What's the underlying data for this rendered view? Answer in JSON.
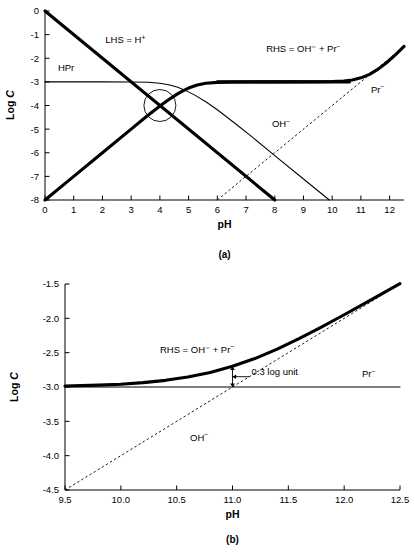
{
  "figure": {
    "type": "multi-panel-line-chart",
    "panels": [
      {
        "id": "a",
        "caption": "(a)",
        "xlabel": "pH",
        "ylabel": "Log C",
        "xlim": [
          0,
          12.5
        ],
        "ylim": [
          -8,
          0
        ],
        "xticks": [
          0,
          1,
          2,
          3,
          4,
          5,
          6,
          7,
          8,
          9,
          10,
          11,
          12
        ],
        "xtick_labels": [
          "0",
          "1",
          "2",
          "3",
          "4",
          "5",
          "6",
          "7",
          "8",
          "9",
          "10",
          "11",
          "12"
        ],
        "yticks": [
          0,
          -1,
          -2,
          -3,
          -4,
          -5,
          -6,
          -7,
          -8
        ],
        "ytick_labels": [
          "0",
          "-1",
          "-2",
          "-3",
          "-4",
          "-5",
          "-6",
          "-7",
          "-8"
        ],
        "grid": false,
        "labels": [
          {
            "name": "lhs-label",
            "text": "LHS = H",
            "sup": "+",
            "x": 2.1,
            "y": -1.35
          },
          {
            "name": "hpr-label",
            "text": "HPr",
            "sup": "",
            "x": 0.45,
            "y": -2.55
          },
          {
            "name": "rhs-label",
            "text": "RHS = OH⁻ + Pr",
            "sup": "−",
            "x": 7.7,
            "y": -1.75
          },
          {
            "name": "pr-label",
            "text": "Pr",
            "sup": "−",
            "x": 11.35,
            "y": -3.45
          },
          {
            "name": "oh-label",
            "text": "OH",
            "sup": "−",
            "x": 7.9,
            "y": -4.9
          }
        ],
        "annotation_circle": {
          "name": "intersection-highlight",
          "cx": 4.0,
          "cy": -4.0,
          "r_px": 16
        },
        "series": [
          {
            "name": "LHS = H+",
            "style": "thick",
            "comment": "log[H+] = -pH, straight line from (0,0) to (8,-8)",
            "points": [
              [
                0,
                0
              ],
              [
                8,
                -8
              ]
            ]
          },
          {
            "name": "Pr-",
            "style": "thick",
            "comment": "rises with slope 1 below pKa then plateaus at -3",
            "points": [
              [
                0,
                -8
              ],
              [
                1,
                -7
              ],
              [
                2,
                -6
              ],
              [
                3,
                -5
              ],
              [
                3.5,
                -4.5
              ],
              [
                4,
                -4.02
              ],
              [
                4.3,
                -3.76
              ],
              [
                4.6,
                -3.52
              ],
              [
                4.8,
                -3.38
              ],
              [
                5.0,
                -3.26
              ],
              [
                5.3,
                -3.13
              ],
              [
                5.6,
                -3.06
              ],
              [
                6.0,
                -3.02
              ],
              [
                6.5,
                -3.005
              ],
              [
                7.5,
                -3.0
              ],
              [
                9.0,
                -3.0
              ],
              [
                10.0,
                -3.0
              ],
              [
                10.6,
                -3.0
              ]
            ]
          },
          {
            "name": "HPr",
            "style": "thin",
            "comment": "flat at -3 below pKa, falls with slope -1 above",
            "points": [
              [
                0,
                -3.0
              ],
              [
                2.0,
                -3.0
              ],
              [
                3.0,
                -3.005
              ],
              [
                3.6,
                -3.02
              ],
              [
                4.0,
                -3.06
              ],
              [
                4.3,
                -3.12
              ],
              [
                4.6,
                -3.22
              ],
              [
                4.87,
                -3.35
              ],
              [
                5.2,
                -3.55
              ],
              [
                5.6,
                -3.84
              ],
              [
                6.0,
                -4.18
              ],
              [
                6.6,
                -4.74
              ],
              [
                7.2,
                -5.32
              ],
              [
                8.0,
                -6.12
              ],
              [
                9.0,
                -7.11
              ],
              [
                9.9,
                -8.0
              ]
            ]
          },
          {
            "name": "OH-",
            "style": "dashed",
            "comment": "log[OH-] = pH - 14, straight dashed line",
            "points": [
              [
                6.0,
                -8.0
              ],
              [
                12.5,
                -1.5
              ]
            ]
          },
          {
            "name": "RHS = OH- + Pr-",
            "style": "thick",
            "comment": "sum of OH- and Pr- curves, merges with Pr- plateau then rises",
            "points": [
              [
                6.0,
                -3.0
              ],
              [
                8.0,
                -3.0
              ],
              [
                9.5,
                -2.995
              ],
              [
                10.0,
                -2.985
              ],
              [
                10.4,
                -2.96
              ],
              [
                10.7,
                -2.92
              ],
              [
                11.0,
                -2.83
              ],
              [
                11.3,
                -2.68
              ],
              [
                11.6,
                -2.46
              ],
              [
                11.9,
                -2.18
              ],
              [
                12.2,
                -1.86
              ],
              [
                12.5,
                -1.5
              ]
            ]
          }
        ]
      },
      {
        "id": "b",
        "caption": "(b)",
        "xlabel": "pH",
        "ylabel": "Log C",
        "xlim": [
          9.5,
          12.5
        ],
        "ylim": [
          -4.5,
          -1.5
        ],
        "xticks": [
          9.5,
          10.0,
          10.5,
          11.0,
          11.5,
          12.0,
          12.5
        ],
        "xtick_labels": [
          "9.5",
          "10.0",
          "10.5",
          "11.0",
          "11.5",
          "12.0",
          "12.5"
        ],
        "yticks": [
          -1.5,
          -2.0,
          -2.5,
          -3.0,
          -3.5,
          -4.0,
          -4.5
        ],
        "ytick_labels": [
          "-1.5",
          "-2.0",
          "-2.5",
          "-3.0",
          "-3.5",
          "-4.0",
          "-4.5"
        ],
        "grid": false,
        "labels": [
          {
            "name": "rhs-label",
            "text": "RHS = OH⁻ + Pr",
            "sup": "−",
            "x": 10.35,
            "y": -2.5
          },
          {
            "name": "pr-label",
            "text": "Pr",
            "sup": "−",
            "x": 12.16,
            "y": -2.86
          },
          {
            "name": "oh-label",
            "text": "OH",
            "sup": "−",
            "x": 10.62,
            "y": -3.78
          },
          {
            "name": "offset-annotation",
            "text": "0.3 log unit",
            "sup": "",
            "x": 11.17,
            "y": -2.82
          }
        ],
        "annotation_arrow": {
          "name": "log-unit-offset-arrow",
          "x": 11.0,
          "y_top": -2.7,
          "y_bottom": -3.0,
          "leader_to_x": 11.15,
          "leader_y": -2.85
        },
        "series": [
          {
            "name": "Pr-",
            "style": "thin",
            "comment": "constant at -3.0 across range",
            "points": [
              [
                9.5,
                -3.0
              ],
              [
                12.5,
                -3.0
              ]
            ]
          },
          {
            "name": "OH-",
            "style": "dashed",
            "comment": "log[OH-] = pH - 14",
            "points": [
              [
                9.5,
                -4.5
              ],
              [
                12.5,
                -1.5
              ]
            ]
          },
          {
            "name": "RHS = OH- + Pr-",
            "style": "thick",
            "comment": "sum curve; exceeds Pr- by 0.3 log unit at pH 11 where OH- = Pr-",
            "points": [
              [
                9.5,
                -2.986
              ],
              [
                9.8,
                -2.973
              ],
              [
                10.0,
                -2.959
              ],
              [
                10.2,
                -2.936
              ],
              [
                10.4,
                -2.903
              ],
              [
                10.6,
                -2.855
              ],
              [
                10.8,
                -2.789
              ],
              [
                11.0,
                -2.699
              ],
              [
                11.2,
                -2.586
              ],
              [
                11.4,
                -2.449
              ],
              [
                11.6,
                -2.293
              ],
              [
                11.8,
                -2.124
              ],
              [
                12.0,
                -1.948
              ],
              [
                12.2,
                -1.767
              ],
              [
                12.5,
                -1.495
              ]
            ]
          }
        ]
      }
    ]
  }
}
